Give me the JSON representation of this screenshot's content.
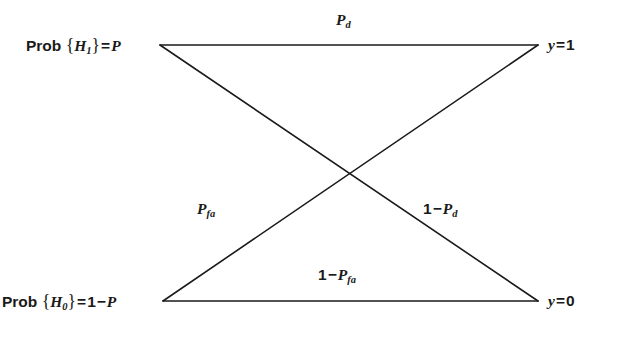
{
  "diagram": {
    "type": "binary-channel-transition-diagram",
    "background_color": "#ffffff",
    "line_color": "#1a1a1a",
    "line_width": 1.6,
    "canvas": {
      "width": 617,
      "height": 342
    },
    "nodes": [
      {
        "id": "h1",
        "position": "top-left",
        "x": 160,
        "y": 45,
        "label_plain": "Prob {H1} = P",
        "label_parts": {
          "prefix": "Prob",
          "open_brace": "{",
          "symbol": "H",
          "subscript": "1",
          "close_brace": "}",
          "equals": "=",
          "value": "P"
        }
      },
      {
        "id": "h0",
        "position": "bottom-left",
        "x": 163,
        "y": 301,
        "label_plain": "Prob {H0} = 1 − P",
        "label_parts": {
          "prefix": "Prob",
          "open_brace": "{",
          "symbol": "H",
          "subscript": "0",
          "close_brace": "}",
          "equals": "=",
          "one": "1",
          "minus": "−",
          "value": "P"
        }
      },
      {
        "id": "y1",
        "position": "top-right",
        "x": 538,
        "y": 45,
        "label_plain": "y = 1",
        "label_parts": {
          "symbol": "y",
          "equals": "=",
          "value": "1"
        }
      },
      {
        "id": "y0",
        "position": "bottom-right",
        "x": 538,
        "y": 301,
        "label_plain": "y = 0",
        "label_parts": {
          "symbol": "y",
          "equals": "=",
          "value": "0"
        }
      }
    ],
    "edges": [
      {
        "id": "pd",
        "from": "h1",
        "to": "y1",
        "x1": 160,
        "y1": 45,
        "x2": 538,
        "y2": 45,
        "label_plain": "Pd",
        "label_parts": {
          "symbol": "P",
          "subscript": "d"
        }
      },
      {
        "id": "1-pd",
        "from": "h1",
        "to": "y0",
        "x1": 160,
        "y1": 45,
        "x2": 538,
        "y2": 301,
        "label_plain": "1 − Pd",
        "label_parts": {
          "one": "1",
          "minus": "−",
          "symbol": "P",
          "subscript": "d"
        }
      },
      {
        "id": "pfa",
        "from": "h0",
        "to": "y1",
        "x1": 163,
        "y1": 301,
        "x2": 538,
        "y2": 45,
        "label_plain": "Pfa",
        "label_parts": {
          "symbol": "P",
          "subscript": "fa"
        }
      },
      {
        "id": "1-pfa",
        "from": "h0",
        "to": "y0",
        "x1": 163,
        "y1": 301,
        "x2": 538,
        "y2": 301,
        "label_plain": "1 − Pfa",
        "label_parts": {
          "one": "1",
          "minus": "−",
          "symbol": "P",
          "subscript": "fa"
        }
      }
    ],
    "crossing_point": {
      "x": 348,
      "y": 173
    }
  }
}
